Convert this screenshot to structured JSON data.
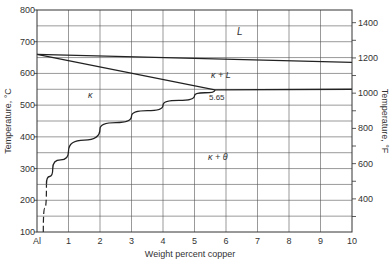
{
  "chart_data": {
    "type": "line",
    "xlabel": "Weight percent copper",
    "ylabel": "Temperature, °C",
    "ylabel_right": "Temperature, °F",
    "xlim": [
      0,
      10
    ],
    "ylim": [
      100,
      800
    ],
    "ylim_right_F": [
      212,
      1472
    ],
    "x_ticks": [
      "Al",
      "1",
      "2",
      "3",
      "4",
      "5",
      "6",
      "7",
      "8",
      "9",
      "10"
    ],
    "y_ticks": [
      "100",
      "200",
      "300",
      "400",
      "500",
      "600",
      "700",
      "800"
    ],
    "y_ticks_right": [
      "400",
      "600",
      "800",
      "1000",
      "1200",
      "1400"
    ],
    "grid": true,
    "series": [
      {
        "name": "Liquidus",
        "x": [
          0,
          10
        ],
        "y": [
          660,
          635
        ]
      },
      {
        "name": "Solidus",
        "x": [
          0,
          5.65
        ],
        "y": [
          660,
          548
        ]
      },
      {
        "name": "Eutectic isotherm",
        "x": [
          5.65,
          10
        ],
        "y": [
          548,
          550
        ]
      },
      {
        "name": "Solvus",
        "x": [
          0.2,
          0.3,
          0.5,
          1.0,
          2.0,
          3.0,
          4.0,
          5.0,
          5.65
        ],
        "y": [
          100,
          250,
          300,
          355,
          425,
          465,
          500,
          530,
          548
        ],
        "dashed_below": 250
      }
    ],
    "annotations": [
      {
        "text": "L",
        "x": 6.3,
        "y": 730
      },
      {
        "text": "κ + L",
        "x": 5.9,
        "y": 600
      },
      {
        "text": "κ",
        "x": 1.7,
        "y": 520
      },
      {
        "text": "5.65",
        "x": 5.65,
        "y": 530
      },
      {
        "text": "κ + θ",
        "x": 5.7,
        "y": 360
      }
    ]
  },
  "labels": {
    "xlabel": "Weight percent copper",
    "ylabel": "Temperature, °C",
    "ylabel_right": "Temperature, °F",
    "region_L": "L",
    "region_kL": "κ + L",
    "region_k": "κ",
    "region_kt": "κ + θ",
    "eutectic_value": "5.65"
  },
  "axes": {
    "x_ticks": [
      "Al",
      "1",
      "2",
      "3",
      "4",
      "5",
      "6",
      "7",
      "8",
      "9",
      "10"
    ],
    "y_ticks": [
      "100",
      "200",
      "300",
      "400",
      "500",
      "600",
      "700",
      "800"
    ],
    "y_ticks_right": [
      "400",
      "600",
      "800",
      "1000",
      "1200",
      "1400"
    ]
  }
}
